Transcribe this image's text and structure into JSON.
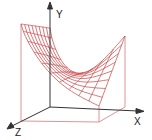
{
  "figure": {
    "colors": {
      "surface": "#c8494b",
      "box": "#d47a7c",
      "axis": "#333333",
      "background": "#ffffff"
    },
    "axes": {
      "x_label": "X",
      "y_label": "Y",
      "z_label": "Z"
    },
    "mesh": {
      "u_lines": 11,
      "v_lines": 9
    },
    "corners": {
      "front_left_top": [
        21,
        24
      ],
      "back_left_top": [
        50,
        28
      ],
      "back_right_top": [
        125,
        36
      ],
      "front_right_top": [
        99,
        106
      ]
    }
  }
}
